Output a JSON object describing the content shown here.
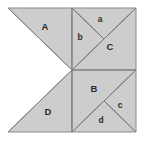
{
  "figure": {
    "kind": "geometric-dissection-diagram",
    "canvas": {
      "width": 145,
      "height": 144,
      "background": "#ffffff"
    },
    "square": {
      "left": 8,
      "top": 8,
      "right": 136,
      "bottom": 132,
      "center_x": 72,
      "center_y": 70
    },
    "style": {
      "fill": "#cdcdcd",
      "stroke": "#8a8a8a",
      "stroke_width": 1,
      "outer_stroke": "#7d7d7d",
      "label_color": "#2b2b2b",
      "label_font_size": 9
    },
    "pieces": [
      {
        "id": "A",
        "label": "A",
        "label_x": 45,
        "label_y": 27,
        "label_size": 9.5,
        "points": "8,8 72,8 72,70 8,8",
        "notes": "upper-left large triangle"
      },
      {
        "id": "D",
        "label": "D",
        "label_x": 48,
        "label_y": 112,
        "label_size": 9.5,
        "points": "8,132 72,132 72,70 8,132",
        "notes": "lower-left large triangle"
      },
      {
        "id": "a",
        "label": "a",
        "label_x": 100,
        "label_y": 20,
        "label_size": 8.5,
        "points": "72,8 136,8 104,39",
        "notes": "small top triangle of upper-right quadrant"
      },
      {
        "id": "b",
        "label": "b",
        "label_x": 80,
        "label_y": 38,
        "label_size": 8.5,
        "points": "72,8 104,39 72,70",
        "notes": "small left triangle of upper-right quadrant"
      },
      {
        "id": "C",
        "label": "C",
        "label_x": 110,
        "label_y": 47,
        "label_size": 9.5,
        "points": "72,70 136,8 136,70",
        "notes": "large lower-right half of upper-right quadrant"
      },
      {
        "id": "B",
        "label": "B",
        "label_x": 94,
        "label_y": 89,
        "label_size": 9.5,
        "points": "72,70 136,70 72,132",
        "notes": "large upper-left half of lower-right quadrant"
      },
      {
        "id": "c",
        "label": "c",
        "label_x": 120,
        "label_y": 106,
        "label_size": 8.5,
        "points": "136,70 136,132 104,101",
        "notes": "small right triangle of lower-right quadrant"
      },
      {
        "id": "d",
        "label": "d",
        "label_x": 101,
        "label_y": 121,
        "label_size": 8.5,
        "points": "72,132 104,101 136,132",
        "notes": "small bottom triangle of lower-right quadrant"
      }
    ],
    "edges": [
      {
        "id": "vertical-midline",
        "x1": 72,
        "y1": 8,
        "x2": 72,
        "y2": 132
      },
      {
        "id": "right-horizontal-midline",
        "x1": 72,
        "y1": 70,
        "x2": 136,
        "y2": 70
      },
      {
        "id": "upper-right-diagonal",
        "x1": 72,
        "y1": 70,
        "x2": 136,
        "y2": 8
      },
      {
        "id": "upper-right-v-left",
        "x1": 72,
        "y1": 8,
        "x2": 104,
        "y2": 39
      },
      {
        "id": "lower-right-diagonal",
        "x1": 72,
        "y1": 132,
        "x2": 136,
        "y2": 70
      },
      {
        "id": "lower-right-v-right",
        "x1": 136,
        "y1": 132,
        "x2": 104,
        "y2": 101
      },
      {
        "id": "notch-upper",
        "x1": 8,
        "y1": 8,
        "x2": 72,
        "y2": 70
      },
      {
        "id": "notch-lower",
        "x1": 8,
        "y1": 132,
        "x2": 72,
        "y2": 70
      },
      {
        "id": "left-edge-upper",
        "x1": 8,
        "y1": 8,
        "x2": 8,
        "y2": 8
      }
    ]
  }
}
